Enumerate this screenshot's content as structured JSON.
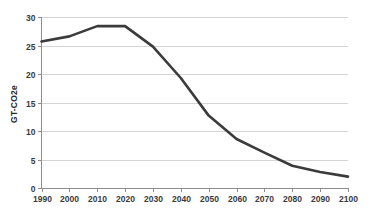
{
  "chart_data": {
    "type": "line",
    "title": "",
    "subtitle": "",
    "xlabel": "",
    "ylabel": "GT-CO2e",
    "x": [
      1990,
      2000,
      2010,
      2020,
      2030,
      2040,
      2050,
      2060,
      2070,
      2080,
      2090,
      2100
    ],
    "categories": [
      "1990",
      "2000",
      "2010",
      "2020",
      "2030",
      "2040",
      "2050",
      "2060",
      "2070",
      "2080",
      "2090",
      "2100"
    ],
    "values": [
      25.7,
      26.6,
      28.4,
      28.4,
      24.8,
      19.3,
      12.7,
      8.6,
      6.2,
      3.9,
      2.8,
      2.0
    ],
    "series": [
      {
        "name": "GT-CO2e",
        "values": [
          25.7,
          26.6,
          28.4,
          28.4,
          24.8,
          19.3,
          12.7,
          8.6,
          6.2,
          3.9,
          2.8,
          2.0
        ],
        "color": "#3b3b3b"
      }
    ],
    "xlim": [
      1990,
      2100
    ],
    "ylim": [
      0,
      30
    ],
    "y_ticks": [
      0,
      5,
      10,
      15,
      20,
      25,
      30
    ],
    "y_tick_labels": [
      "0",
      "5",
      "10",
      "15",
      "20",
      "25",
      "30"
    ],
    "x_ticks": [
      1990,
      2000,
      2010,
      2020,
      2030,
      2040,
      2050,
      2060,
      2070,
      2080,
      2090,
      2100
    ],
    "x_tick_labels": [
      "1990",
      "2000",
      "2010",
      "2020",
      "2030",
      "2040",
      "2050",
      "2060",
      "2070",
      "2080",
      "2090",
      "2100"
    ],
    "grid": "horizontal",
    "legend": "none",
    "legend_position": "",
    "annotations": [],
    "colors": {
      "line": "#3b3b3b",
      "grid": "#c9c9c9",
      "axis": "#8d8d8d",
      "text": "#3a3a3a",
      "background": "#ffffff"
    }
  },
  "axis": {
    "y_title": "GT-CO2e"
  }
}
